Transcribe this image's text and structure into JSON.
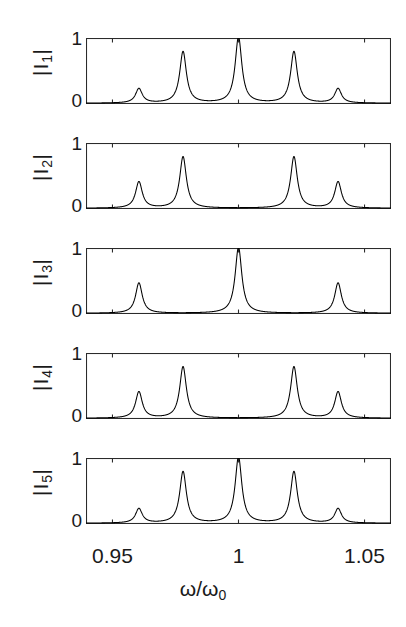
{
  "figure": {
    "axis": {
      "x_title_main": "ω/ω",
      "x_title_sub": "0",
      "x_ticks": [
        {
          "label": "0.95",
          "value": 0.95
        },
        {
          "label": "1",
          "value": 1.0
        },
        {
          "label": "1.05",
          "value": 1.05
        }
      ],
      "y_tick_top": "1",
      "y_tick_bottom": "0"
    },
    "panels": [
      {
        "label_bars": "|",
        "label_core": "I",
        "label_sub": "1",
        "full_label": "|I1|"
      },
      {
        "label_bars": "|",
        "label_core": "I",
        "label_sub": "2",
        "full_label": "|I2|"
      },
      {
        "label_bars": "|",
        "label_core": "I",
        "label_sub": "3",
        "full_label": "|I3|"
      },
      {
        "label_bars": "|",
        "label_core": "I",
        "label_sub": "4",
        "full_label": "|I4|"
      },
      {
        "label_bars": "|",
        "label_core": "I",
        "label_sub": "5",
        "full_label": "|I5|"
      }
    ]
  },
  "chart_data": {
    "type": "line",
    "title": "",
    "xlabel": "ω/ω₀",
    "ylabel": "|Iₙ|",
    "xlim": [
      0.9395,
      1.0605
    ],
    "ylim": [
      0,
      1
    ],
    "grid": false,
    "legend": "none",
    "x_ticks": [
      0.95,
      1.0,
      1.05
    ],
    "y_ticks": [
      0,
      1
    ],
    "resonance_frequencies": [
      0.9605,
      0.978,
      1.0,
      1.022,
      1.0395
    ],
    "peak_halfwidth": 0.0016,
    "baseline": 0.02,
    "series": [
      {
        "name": "|I1|",
        "panel": 1,
        "amplitudes": [
          0.22,
          0.78,
          1.0,
          0.78,
          0.22
        ]
      },
      {
        "name": "|I2|",
        "panel": 2,
        "amplitudes": [
          0.4,
          0.78,
          0.0,
          0.78,
          0.4
        ]
      },
      {
        "name": "|I3|",
        "panel": 3,
        "amplitudes": [
          0.46,
          0.0,
          1.0,
          0.0,
          0.46
        ]
      },
      {
        "name": "|I4|",
        "panel": 4,
        "amplitudes": [
          0.4,
          0.78,
          0.0,
          0.78,
          0.4
        ]
      },
      {
        "name": "|I5|",
        "panel": 5,
        "amplitudes": [
          0.22,
          0.78,
          1.0,
          0.78,
          0.22
        ]
      }
    ]
  }
}
